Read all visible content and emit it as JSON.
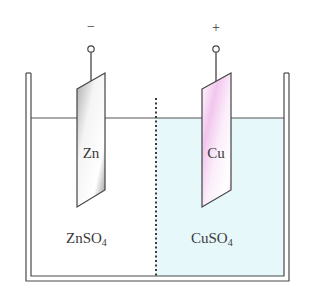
{
  "diagram": {
    "type": "galvanic-cell",
    "colors": {
      "line": "#4a4a4a",
      "solution_right": "#e6f8fa",
      "zn_plate_dark": "#9a9a9a",
      "zn_plate_light": "#f2f2f2",
      "cu_plate_tint": "#f0c8ec"
    },
    "electrodes": {
      "left": {
        "label": "Zn",
        "polarity": "−"
      },
      "right": {
        "label": "Cu",
        "polarity": "+"
      }
    },
    "solutions": {
      "left": {
        "formula": "ZnSO",
        "subscript": "4"
      },
      "right": {
        "formula": "CuSO",
        "subscript": "4"
      }
    },
    "separator": "porous-barrier-dotted-line"
  }
}
